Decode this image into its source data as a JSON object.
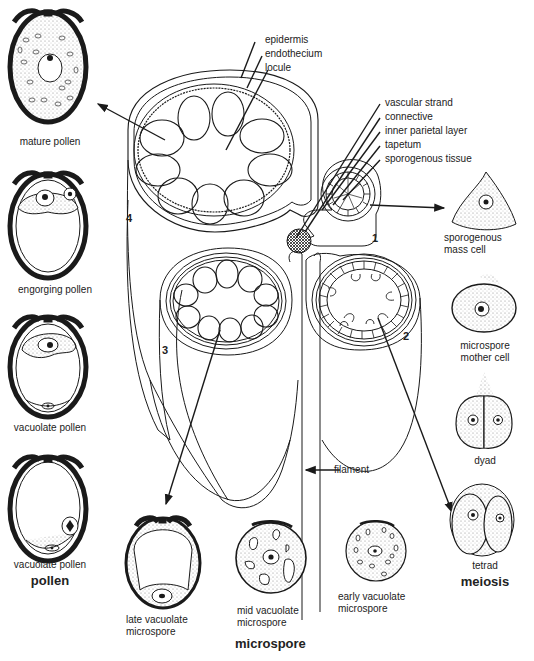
{
  "anther_labels": {
    "outer_top": [
      "epidermis",
      "endothecium",
      "locule"
    ],
    "outer_right": [
      "vascular strand",
      "connective",
      "inner parietal layer",
      "tapetum",
      "sporogenous tissue"
    ],
    "filament": "filament"
  },
  "locule_numbers": [
    "1",
    "2",
    "3",
    "4"
  ],
  "pollen": {
    "group_label": "pollen",
    "stages": [
      "mature pollen",
      "engorging pollen",
      "vacuolate pollen",
      "vacuolate pollen"
    ]
  },
  "meiosis": {
    "group_label": "meiosis",
    "stages": [
      "sporogenous\nmass cell",
      "microspore\nmother cell",
      "dyad",
      "tetrad"
    ]
  },
  "microspore": {
    "group_label": "microspore",
    "stages": [
      "late vacuolate\nmicrospore",
      "mid vacuolate\nmicrospore",
      "early vacuolate\nmicrospore"
    ]
  },
  "colors": {
    "line": "#1a1a1a",
    "background": "#ffffff",
    "stipple": "#9a9a9a"
  }
}
